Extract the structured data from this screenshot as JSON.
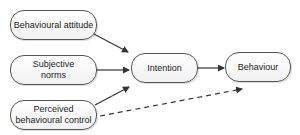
{
  "diagram": {
    "nodes": [
      {
        "id": "attitude",
        "label": "Behavioural attitude"
      },
      {
        "id": "norms",
        "label": "Subjective norms"
      },
      {
        "id": "control",
        "label": "Perceived behavioural control"
      },
      {
        "id": "intention",
        "label": "Intention"
      },
      {
        "id": "behaviour",
        "label": "Behaviour"
      }
    ],
    "edges": [
      {
        "from": "attitude",
        "to": "intention",
        "style": "solid"
      },
      {
        "from": "norms",
        "to": "intention",
        "style": "solid"
      },
      {
        "from": "control",
        "to": "intention",
        "style": "solid"
      },
      {
        "from": "intention",
        "to": "behaviour",
        "style": "solid"
      },
      {
        "from": "control",
        "to": "behaviour",
        "style": "dashed"
      }
    ],
    "colors": {
      "stroke": "#333333",
      "node_border": "#555555",
      "node_fill": "#f5f5f5"
    }
  }
}
